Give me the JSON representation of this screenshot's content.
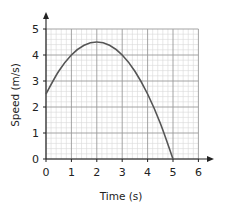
{
  "chart_data": {
    "type": "line",
    "title": "",
    "xlabel": "Time (s)",
    "ylabel": "Speed (m/s)",
    "xlim": [
      0,
      6
    ],
    "ylim": [
      0,
      5
    ],
    "x_ticks": [
      "0",
      "1",
      "2",
      "3",
      "4",
      "5",
      "6"
    ],
    "y_ticks": [
      "0",
      "1",
      "2",
      "3",
      "4",
      "5"
    ],
    "grid": true,
    "minor_grid_divisions": 5,
    "legend": null,
    "series": [
      {
        "name": "speed",
        "color": "#555555",
        "x": [
          0,
          0.5,
          1,
          1.5,
          2,
          2.5,
          3,
          3.5,
          4,
          4.5,
          5
        ],
        "values": [
          2.5,
          3.375,
          4.0,
          4.375,
          4.5,
          4.375,
          4.0,
          3.375,
          2.5,
          1.375,
          0
        ]
      }
    ]
  },
  "colors": {
    "minor_grid": "#d9d9d9",
    "major_grid": "#9a9a9a",
    "axis": "#222222",
    "curve": "#555555"
  }
}
